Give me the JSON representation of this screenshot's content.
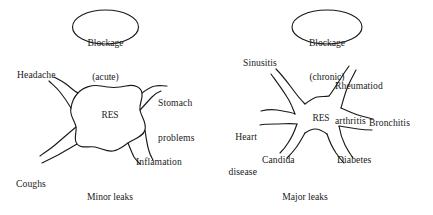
{
  "figure": {
    "background_color": "#ffffff",
    "stroke_color": "#1a1a1a",
    "text_color": "#1a1a1a"
  },
  "panels": [
    {
      "id": "acute",
      "bubble": {
        "line1": "Blockage",
        "line2": "(acute)"
      },
      "core_label": "RES",
      "caption": "Minor leaks",
      "leaks": [
        {
          "id": "headache",
          "label": "Headache",
          "line2": ""
        },
        {
          "id": "stomach-problems",
          "label": "Stomach",
          "line2": "problems"
        },
        {
          "id": "coughs-colds",
          "label": "Coughs",
          "line2": "colds"
        },
        {
          "id": "inflamation",
          "label": "Inflamation",
          "line2": ""
        }
      ]
    },
    {
      "id": "chronic",
      "bubble": {
        "line1": "Blockage",
        "line2": "(chronic)"
      },
      "core_label": "RES",
      "caption": "Major leaks",
      "leaks": [
        {
          "id": "sinusitis",
          "label": "Sinusitis",
          "line2": ""
        },
        {
          "id": "rheumatiod-arthritis",
          "label": "Rheumatiod",
          "line2": "arthritis"
        },
        {
          "id": "heart-disease",
          "label": "Heart",
          "line2": "disease"
        },
        {
          "id": "bronchitis",
          "label": "Bronchitis",
          "line2": ""
        },
        {
          "id": "candida",
          "label": "Candida",
          "line2": ""
        },
        {
          "id": "diabetes",
          "label": "Diabetes",
          "line2": ""
        }
      ]
    }
  ]
}
